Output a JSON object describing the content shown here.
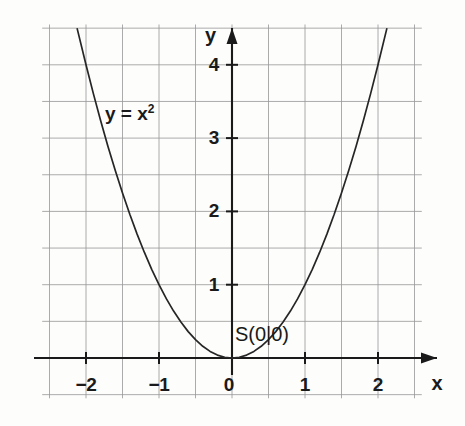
{
  "chart_data": {
    "type": "line",
    "title": "",
    "subtitle": "",
    "function_label": "y = x",
    "function_exponent": "2",
    "expression": "y = x^2",
    "xlabel": "x",
    "ylabel": "y",
    "xlim": [
      -2.6,
      2.6
    ],
    "ylim": [
      -0.55,
      4.55
    ],
    "x_ticks": [
      -2,
      -1,
      0,
      1,
      2
    ],
    "x_tick_labels": [
      "−2",
      "−1",
      "0",
      "1",
      "2"
    ],
    "y_ticks": [
      1,
      2,
      3,
      4
    ],
    "y_tick_labels": [
      "1",
      "2",
      "3",
      "4"
    ],
    "grid": true,
    "grid_step": 0.5,
    "legend": "none",
    "annotations": [
      {
        "name": "vertex",
        "text": "S(0|0)",
        "x": 0.12,
        "y": 0.3
      },
      {
        "name": "curve-equation",
        "text": "y = x²",
        "x": -1.72,
        "y": 3.3
      }
    ],
    "series": [
      {
        "name": "y = x²",
        "color": "#262626",
        "x": [
          -2.12,
          -2.0,
          -1.9,
          -1.8,
          -1.7,
          -1.6,
          -1.5,
          -1.4,
          -1.3,
          -1.2,
          -1.1,
          -1.0,
          -0.9,
          -0.8,
          -0.7,
          -0.6,
          -0.5,
          -0.4,
          -0.3,
          -0.2,
          -0.1,
          0,
          0.1,
          0.2,
          0.3,
          0.4,
          0.5,
          0.6,
          0.7,
          0.8,
          0.9,
          1.0,
          1.1,
          1.2,
          1.3,
          1.4,
          1.5,
          1.6,
          1.7,
          1.8,
          1.9,
          2.0,
          2.12
        ],
        "values": [
          4.49,
          4.0,
          3.61,
          3.24,
          2.89,
          2.56,
          2.25,
          1.96,
          1.69,
          1.44,
          1.21,
          1.0,
          0.81,
          0.64,
          0.49,
          0.36,
          0.25,
          0.16,
          0.09,
          0.04,
          0.01,
          0,
          0.01,
          0.04,
          0.09,
          0.16,
          0.25,
          0.36,
          0.49,
          0.64,
          0.81,
          1.0,
          1.21,
          1.44,
          1.69,
          1.96,
          2.25,
          2.56,
          2.89,
          3.24,
          3.61,
          4.0,
          4.49
        ]
      }
    ],
    "colors": {
      "grid": "#9a9a9a",
      "axis": "#1a1a1a",
      "curve": "#262626",
      "text": "#1a1a1a",
      "background": "#fdfdfc"
    }
  },
  "labels": {
    "y_axis_name": "y",
    "x_axis_name": "x",
    "curve_equation_base": "y = x",
    "curve_equation_exponent": "2",
    "vertex_point": "S(0|0)",
    "y_tick_4": "4",
    "y_tick_3": "3",
    "y_tick_2": "2",
    "y_tick_1": "1",
    "x_tick_neg2": "−2",
    "x_tick_neg1": "−1",
    "x_tick_0": "0",
    "x_tick_1": "1",
    "x_tick_2": "2"
  }
}
